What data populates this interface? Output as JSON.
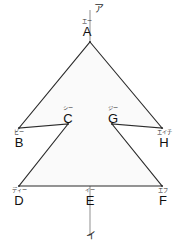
{
  "figure": {
    "canvas": {
      "width": 181,
      "height": 248
    },
    "colors": {
      "background": "#ffffff",
      "fill": "#fafafa",
      "stroke": "#2b2b2b",
      "axis": "#9a9a9a",
      "text": "#111111"
    },
    "axis": {
      "top_label": "ア",
      "bottom_label": "イ",
      "x": 90,
      "y_top": 10,
      "y_bottom": 236
    },
    "vertices": [
      {
        "id": "A",
        "roman": "A",
        "kana": "エー",
        "x": 90,
        "y": 42
      },
      {
        "id": "B",
        "roman": "B",
        "kana": "ビー",
        "x": 19,
        "y": 128
      },
      {
        "id": "C",
        "roman": "C",
        "kana": "シー",
        "x": 68,
        "y": 124
      },
      {
        "id": "D",
        "roman": "D",
        "kana": "ディー",
        "x": 19,
        "y": 186
      },
      {
        "id": "E",
        "roman": "E",
        "kana": "イー",
        "x": 90,
        "y": 186
      },
      {
        "id": "F",
        "roman": "F",
        "kana": "エフ",
        "x": 162,
        "y": 186
      },
      {
        "id": "G",
        "roman": "G",
        "kana": "ジー",
        "x": 112,
        "y": 124
      },
      {
        "id": "H",
        "roman": "H",
        "kana": "エイチ",
        "x": 162,
        "y": 128
      }
    ],
    "polygon_path": "M 90 42 L 162 128 L 112 124 L 162 186 L 19 186 L 68 124 L 19 128 Z",
    "outline_order": [
      "A",
      "H",
      "G",
      "F",
      "D",
      "C",
      "B"
    ]
  }
}
